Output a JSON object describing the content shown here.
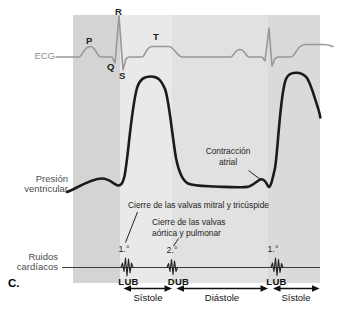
{
  "figure_label": "C.",
  "ecg": {
    "label": "ECG",
    "wave_labels": {
      "p": "P",
      "q": "Q",
      "r": "R",
      "s": "S",
      "t": "T"
    }
  },
  "pressure": {
    "label_line1": "Presión",
    "label_line2": "ventricular"
  },
  "sounds": {
    "label_line1": "Ruidos",
    "label_line2": "cardíacos",
    "first_sound": "1.°",
    "second_sound": "2.°",
    "third_sound": "1.°",
    "lub1": "LUB",
    "dub": "DUB",
    "lub2": "LUB"
  },
  "annotations": {
    "mitral_closure": "Cierre de las valvas mitral y tricúspide",
    "aortic_closure_line1": "Cierre de las valvas",
    "aortic_closure_line2": "aórtica y pulmonar",
    "atrial_line1": "Contracción",
    "atrial_line2": "atrial"
  },
  "phases": {
    "systole1": "Sístole",
    "diastole": "Diástole",
    "systole2": "Sístole"
  },
  "colors": {
    "background": "#ffffff",
    "ecg_trace": "#989898",
    "pressure_trace": "#1b1b1b",
    "sounds_line": "#3a3a3a",
    "band_pre_systole": "#d4d4d4",
    "band_systole_1": "#e9e9e9",
    "band_diastole": "#e1e1e1",
    "band_systole_2": "#dadada",
    "annotation_text": "#1f1f1f",
    "ecg_label_text": "#8f8f8f",
    "side_label_text": "#4d4d4d"
  }
}
